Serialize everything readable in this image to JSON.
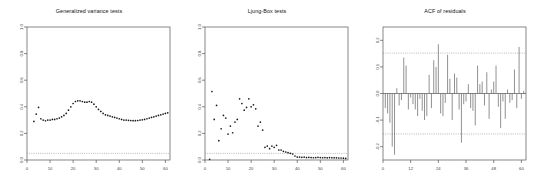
{
  "figure": {
    "background": "#ffffff",
    "width": 536,
    "height": 191,
    "point_color": "#1a1a1a",
    "axis_color": "#555555",
    "dashed_color": "#888888",
    "spike_color": "#555555"
  },
  "panels": [
    {
      "id": "generalized-variance-tests",
      "title": "Generalized variance tests",
      "type": "scatter",
      "xlabel": "",
      "ylabel": "",
      "xlim": [
        0,
        62
      ],
      "ylim": [
        0.0,
        1.0
      ],
      "xticks": [
        0,
        10,
        20,
        30,
        40,
        50,
        60
      ],
      "xtick_labels": [
        "0",
        "10",
        "20",
        "30",
        "40",
        "50",
        "60"
      ],
      "yticks": [
        0.0,
        0.2,
        0.4,
        0.6,
        0.8,
        1.0
      ],
      "ytick_labels": [
        "0.0",
        "0.2",
        "0.4",
        "0.6",
        "0.8",
        "1.0"
      ],
      "hline": 0.05,
      "hline_style": "dotted"
    },
    {
      "id": "ljung-box-tests",
      "title": "Ljung-Box tests",
      "type": "scatter",
      "xlabel": "",
      "ylabel": "",
      "xlim": [
        0,
        62
      ],
      "ylim": [
        0.0,
        1.0
      ],
      "xticks": [
        0,
        10,
        20,
        30,
        40,
        50,
        60
      ],
      "xtick_labels": [
        "0",
        "10",
        "20",
        "30",
        "40",
        "50",
        "60"
      ],
      "yticks": [
        0.0,
        0.2,
        0.4,
        0.6,
        0.8,
        1.0
      ],
      "ytick_labels": [
        "0.0",
        "0.2",
        "0.4",
        "0.6",
        "0.8",
        "1.0"
      ],
      "hline": 0.05,
      "hline_style": "dotted"
    },
    {
      "id": "acf-of-residuals",
      "title": "ACF of residuals",
      "type": "stem",
      "xlabel": "",
      "ylabel": "",
      "xlim": [
        0,
        62
      ],
      "ylim": [
        -0.25,
        0.25
      ],
      "xticks": [
        0,
        12,
        24,
        36,
        48,
        60
      ],
      "xtick_labels": [
        "0",
        "12",
        "24",
        "36",
        "48",
        "60"
      ],
      "yticks": [
        -0.2,
        -0.1,
        0.0,
        0.1,
        0.2
      ],
      "ytick_labels": [
        "-0.2",
        "-0.1",
        "0.0",
        "0.1",
        "0.2"
      ],
      "hline": 0.0,
      "conf_upper": 0.152,
      "conf_lower": -0.152,
      "hline_style": "dotted"
    }
  ],
  "chart_data": [
    {
      "type": "scatter",
      "title": "Generalized variance tests",
      "xlabel": "",
      "ylabel": "",
      "xlim": [
        0,
        62
      ],
      "ylim": [
        0.0,
        1.0
      ],
      "grid": false,
      "legend": "none",
      "annotations": [
        {
          "kind": "hline",
          "y": 0.05,
          "style": "dotted",
          "label": "0.05 significance level"
        }
      ],
      "x": [
        3,
        4,
        5,
        6,
        7,
        8,
        9,
        10,
        11,
        12,
        13,
        14,
        15,
        16,
        17,
        18,
        19,
        20,
        21,
        22,
        23,
        24,
        25,
        26,
        27,
        28,
        29,
        30,
        31,
        32,
        33,
        34,
        35,
        36,
        37,
        38,
        39,
        40,
        41,
        42,
        43,
        44,
        45,
        46,
        47,
        48,
        49,
        50,
        51,
        52,
        53,
        54,
        55,
        56,
        57,
        58,
        59,
        60,
        61
      ],
      "y": [
        0.29,
        0.345,
        0.395,
        0.31,
        0.3,
        0.295,
        0.3,
        0.3,
        0.305,
        0.305,
        0.31,
        0.315,
        0.325,
        0.335,
        0.35,
        0.375,
        0.4,
        0.425,
        0.44,
        0.445,
        0.445,
        0.44,
        0.435,
        0.435,
        0.44,
        0.435,
        0.42,
        0.4,
        0.38,
        0.365,
        0.35,
        0.34,
        0.335,
        0.33,
        0.325,
        0.32,
        0.315,
        0.31,
        0.305,
        0.3,
        0.3,
        0.298,
        0.297,
        0.296,
        0.296,
        0.297,
        0.3,
        0.302,
        0.305,
        0.31,
        0.315,
        0.32,
        0.325,
        0.33,
        0.335,
        0.34,
        0.345,
        0.35,
        0.355
      ]
    },
    {
      "type": "scatter",
      "title": "Ljung-Box tests",
      "xlabel": "",
      "ylabel": "",
      "xlim": [
        0,
        62
      ],
      "ylim": [
        0.0,
        1.0
      ],
      "grid": false,
      "legend": "none",
      "annotations": [
        {
          "kind": "hline",
          "y": 0.05,
          "style": "dotted",
          "label": "0.05 significance level"
        }
      ],
      "x": [
        2,
        3,
        4,
        5,
        6,
        7,
        8,
        9,
        10,
        11,
        12,
        13,
        14,
        15,
        16,
        17,
        18,
        19,
        20,
        21,
        22,
        23,
        24,
        25,
        26,
        27,
        28,
        29,
        30,
        31,
        32,
        33,
        34,
        35,
        36,
        37,
        38,
        39,
        40,
        41,
        42,
        43,
        44,
        45,
        46,
        47,
        48,
        49,
        50,
        51,
        52,
        53,
        54,
        55,
        56,
        57,
        58,
        59,
        60,
        61
      ],
      "y": [
        0.005,
        0.515,
        0.305,
        0.41,
        0.145,
        0.235,
        0.335,
        0.315,
        0.195,
        0.255,
        0.205,
        0.285,
        0.305,
        0.46,
        0.425,
        0.375,
        0.395,
        0.46,
        0.4,
        0.415,
        0.385,
        0.255,
        0.285,
        0.225,
        0.095,
        0.105,
        0.085,
        0.105,
        0.095,
        0.11,
        0.075,
        0.075,
        0.065,
        0.06,
        0.055,
        0.05,
        0.045,
        0.03,
        0.022,
        0.022,
        0.02,
        0.022,
        0.018,
        0.02,
        0.018,
        0.017,
        0.018,
        0.02,
        0.018,
        0.017,
        0.018,
        0.016,
        0.018,
        0.017,
        0.016,
        0.016,
        0.015,
        0.015,
        0.014,
        0.012
      ]
    },
    {
      "type": "bar",
      "title": "ACF of residuals",
      "xlabel": "",
      "ylabel": "",
      "xlim": [
        0,
        62
      ],
      "ylim": [
        -0.25,
        0.25
      ],
      "grid": false,
      "legend": "none",
      "annotations": [
        {
          "kind": "hline",
          "y": 0.152,
          "style": "dotted",
          "label": "upper confidence bound"
        },
        {
          "kind": "hline",
          "y": -0.152,
          "style": "dotted",
          "label": "lower confidence bound"
        },
        {
          "kind": "hline",
          "y": 0.0,
          "style": "solid",
          "label": "zero line"
        }
      ],
      "categories": [
        1,
        2,
        3,
        4,
        5,
        6,
        7,
        8,
        9,
        10,
        11,
        12,
        13,
        14,
        15,
        16,
        17,
        18,
        19,
        20,
        21,
        22,
        23,
        24,
        25,
        26,
        27,
        28,
        29,
        30,
        31,
        32,
        33,
        34,
        35,
        36,
        37,
        38,
        39,
        40,
        41,
        42,
        43,
        44,
        45,
        46,
        47,
        48,
        49,
        50,
        51,
        52,
        53,
        54,
        55,
        56,
        57,
        58,
        59,
        60,
        61
      ],
      "values": [
        -0.055,
        -0.075,
        -0.11,
        -0.2,
        -0.23,
        0.02,
        -0.045,
        -0.025,
        0.135,
        0.105,
        -0.06,
        -0.015,
        -0.04,
        -0.06,
        -0.085,
        -0.02,
        -0.065,
        -0.1,
        -0.085,
        0.07,
        -0.055,
        0.125,
        0.1,
        0.185,
        -0.075,
        -0.085,
        -0.035,
        0.145,
        0.055,
        -0.1,
        0.075,
        0.06,
        -0.06,
        -0.185,
        -0.04,
        -0.03,
        0.035,
        -0.055,
        -0.065,
        -0.12,
        0.105,
        0.035,
        0.045,
        -0.045,
        0.08,
        -0.095,
        0.015,
        0.045,
        0.105,
        -0.05,
        -0.13,
        -0.03,
        -0.095,
        0.015,
        -0.035,
        -0.025,
        0.09,
        -0.055,
        0.175,
        -0.02,
        0.01
      ]
    }
  ]
}
